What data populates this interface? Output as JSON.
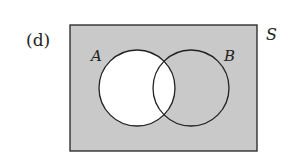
{
  "figure": {
    "label": "(d)",
    "universe_label": "S",
    "set_a_label": "A",
    "set_b_label": "B",
    "shaded_region": "complement of B union A (A is unshaded)",
    "colors": {
      "shade": "#c9c9c9",
      "unshaded": "#ffffff",
      "stroke": "#222222"
    }
  }
}
